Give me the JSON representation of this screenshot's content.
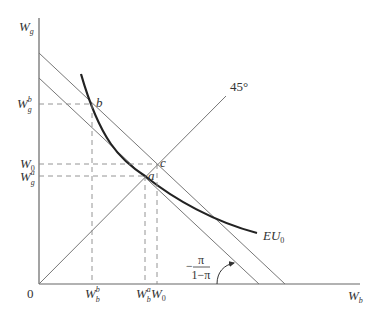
{
  "diagram": {
    "type": "expected-utility-indifference",
    "axes": {
      "y_label_main": "W",
      "y_label_sub": "g",
      "x_label_main": "W",
      "x_label_sub": "b",
      "origin": "0"
    },
    "y_ticks": [
      {
        "main": "W",
        "sup": "b",
        "sub": "g",
        "id": "Wg_b"
      },
      {
        "main": "W",
        "sup": "",
        "sub": "0",
        "id": "W0"
      },
      {
        "main": "W",
        "sup": "a",
        "sub": "g",
        "id": "Wg_a"
      }
    ],
    "x_ticks": [
      {
        "main": "W",
        "sup": "b",
        "sub": "b",
        "id": "Wb_b"
      },
      {
        "main": "W",
        "sup": "a",
        "sub": "b",
        "id": "Wb_a"
      },
      {
        "main": "W",
        "sup": "",
        "sub": "0",
        "id": "W0"
      }
    ],
    "points": {
      "a": "a",
      "b": "b",
      "c": "c"
    },
    "curve_label_main": "EU",
    "curve_label_sub": "0",
    "certainty_line_label": "45°",
    "slope_label": {
      "sign": "−",
      "numerator": "π",
      "denominator": "1−π"
    },
    "colors": {
      "axis": "#666666",
      "line": "#777777",
      "curve": "#222222",
      "guide": "#888888",
      "text": "#333333"
    }
  }
}
